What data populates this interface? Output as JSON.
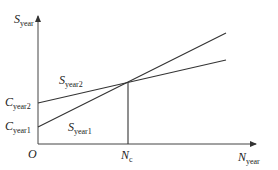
{
  "diagram": {
    "y_axis": {
      "symbol": "S",
      "subscript": "year"
    },
    "x_axis": {
      "symbol": "N",
      "subscript": "year"
    },
    "origin": "O",
    "intercepts": [
      {
        "symbol": "C",
        "subscript": "year2"
      },
      {
        "symbol": "C",
        "subscript": "year1"
      }
    ],
    "lines": [
      {
        "symbol": "S",
        "subscript": "year2"
      },
      {
        "symbol": "S",
        "subscript": "year1"
      }
    ],
    "crossover": {
      "symbol": "N",
      "subscript": "c"
    }
  }
}
